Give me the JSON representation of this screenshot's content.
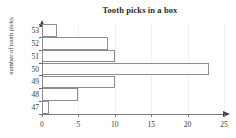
{
  "chart_data": {
    "type": "bar",
    "orientation": "horizontal",
    "title": "Tooth picks in a box",
    "xlabel": "",
    "ylabel_line1": "number of",
    "ylabel_line2": "tooth picks",
    "categories": [
      "53",
      "52",
      "51",
      "50",
      "49",
      "48",
      "47"
    ],
    "values": [
      2,
      9,
      10,
      23,
      10,
      5,
      1
    ],
    "xlim": [
      0,
      25
    ],
    "xticks": [
      "0",
      "5",
      "10",
      "15",
      "20",
      "25"
    ],
    "xtick_values": [
      0,
      5,
      10,
      15,
      20,
      25
    ],
    "yticks": [
      "53",
      "52",
      "51",
      "50",
      "49",
      "48",
      "47"
    ],
    "grid": false,
    "legend": "none",
    "bar_fill_color": "#fefefe",
    "bar_edge_color": "#8d8d8d",
    "axis_color": "#555555",
    "text_color": "#3a3a3a"
  }
}
